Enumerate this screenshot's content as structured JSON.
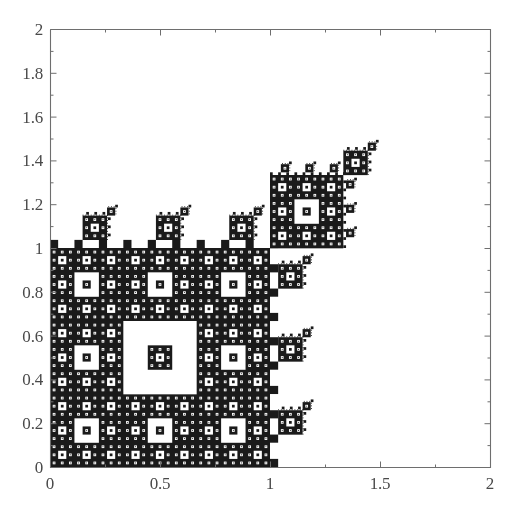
{
  "figure": {
    "background_color": "#ffffff",
    "ink_color": "#1a1a1a",
    "axis_color": "#6e6e6e",
    "label_color": "#4a4a4a",
    "plot_box": {
      "left": 50,
      "top": 29,
      "right": 490,
      "bottom": 467
    }
  },
  "chart_data": {
    "type": "scatter",
    "title": "",
    "xlabel": "",
    "ylabel": "",
    "xlim": [
      0,
      2
    ],
    "ylim": [
      0,
      2
    ],
    "grid": false,
    "legend": null,
    "xticks": [
      0,
      0.5,
      1,
      1.5,
      2
    ],
    "xticklabels": [
      "0",
      "0.5",
      "1",
      "1.5",
      "2"
    ],
    "yticks": [
      0,
      0.2,
      0.4,
      0.6,
      0.8,
      1,
      1.2,
      1.4,
      1.6,
      1.8,
      2
    ],
    "yticklabels": [
      "0",
      "0.2",
      "0.4",
      "0.6",
      "0.8",
      "1",
      "1.2",
      "1.4",
      "1.6",
      "1.8",
      "2"
    ],
    "minor_xticks": [
      0.25,
      0.75,
      1.25,
      1.75
    ],
    "minor_yticks": [
      0.1,
      0.3,
      0.5,
      0.7,
      0.9,
      1.1,
      1.3,
      1.5,
      1.7,
      1.9
    ],
    "fractal": {
      "base_square": {
        "x0": 0,
        "y0": 0,
        "x1": 1,
        "y1": 1
      },
      "subdivision": 3,
      "hole_cell": [
        1,
        1
      ],
      "diagonal_offset": 1,
      "scale_per_level": 0.3333333333,
      "max_depth": 5,
      "point_count_note": "dense attractor rendered as filled cells"
    },
    "series": [
      {
        "name": "fractal-attractor",
        "color": "#1a1a1a",
        "marker": "square",
        "anchor_blocks": [
          {
            "x": 0.0,
            "y": 0.0,
            "size": 1.0,
            "label": "main-unit-square"
          },
          {
            "x": 1.0,
            "y": 1.0,
            "size": 0.333333,
            "label": "first-diagonal-copy"
          },
          {
            "x": 1.333333,
            "y": 1.333333,
            "size": 0.333333,
            "label": "second-diagonal-copy"
          },
          {
            "x": 1.777778,
            "y": 1.777778,
            "size": 0.111111,
            "label": "third-diagonal-copy"
          },
          {
            "x": 1.0,
            "y": 0.444444,
            "size": 0.111111,
            "label": "right-branch-copy-low"
          },
          {
            "x": 1.111111,
            "y": 0.777778,
            "size": 0.111111,
            "label": "right-branch-copy-mid"
          },
          {
            "x": 0.444444,
            "y": 1.111111,
            "size": 0.111111,
            "label": "top-branch-copy-left"
          },
          {
            "x": 0.777778,
            "y": 1.111111,
            "size": 0.111111,
            "label": "top-branch-copy-right"
          },
          {
            "x": 1.111111,
            "y": 1.111111,
            "size": 0.111111,
            "label": "top-branch-copy-corner"
          }
        ]
      }
    ]
  },
  "accessibility": {
    "figure_role": "fractal scatter plot",
    "summary": "Black fractal set occupying the unit square with a recursive chain of shrinking copies along the diagonal up to coordinate (2,2)."
  }
}
